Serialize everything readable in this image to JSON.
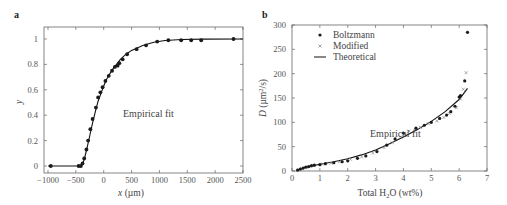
{
  "chart_data": [
    {
      "panel": "a",
      "type": "scatter",
      "title": "",
      "xlabel": "x (µm)",
      "ylabel": "y",
      "xlim": [
        -1000,
        2500
      ],
      "ylim": [
        0,
        1
      ],
      "xticks": [
        -1000,
        -500,
        0,
        500,
        1000,
        1500,
        2000,
        2500
      ],
      "xtick_labels": [
        "−1000",
        "−500",
        "0",
        "500",
        "1000",
        "1500",
        "2000",
        "2500"
      ],
      "yticks": [
        0,
        0.2,
        0.4,
        0.6,
        0.8,
        1
      ],
      "ytick_labels": [
        "0",
        "0.2",
        "0.4",
        "0.6",
        "0.8",
        "1"
      ],
      "grid": false,
      "annotations": [
        "Empirical fit"
      ],
      "series": [
        {
          "name": "data",
          "marker": "filled-circle",
          "x": [
            -950,
            -450,
            -410,
            -380,
            -350,
            -310,
            -280,
            -240,
            -200,
            -140,
            -100,
            -60,
            -20,
            30,
            90,
            150,
            200,
            250,
            280,
            340,
            420,
            590,
            760,
            960,
            1160,
            1390,
            1570,
            1750,
            2330
          ],
          "y": [
            0,
            0,
            0,
            0.02,
            0.06,
            0.13,
            0.2,
            0.29,
            0.37,
            0.46,
            0.54,
            0.58,
            0.62,
            0.67,
            0.71,
            0.75,
            0.78,
            0.79,
            0.81,
            0.84,
            0.88,
            0.92,
            0.95,
            0.98,
            0.99,
            0.99,
            0.99,
            0.99,
            1.0
          ]
        },
        {
          "name": "Empirical fit",
          "line": "solid",
          "x": [
            -1000,
            -400,
            -350,
            -300,
            -250,
            -200,
            -150,
            -100,
            -50,
            0,
            50,
            100,
            150,
            200,
            300,
            400,
            500,
            700,
            900,
            1100,
            1400,
            1800,
            2500
          ],
          "y": [
            0,
            0,
            0.05,
            0.14,
            0.24,
            0.34,
            0.43,
            0.51,
            0.57,
            0.63,
            0.68,
            0.72,
            0.755,
            0.785,
            0.84,
            0.88,
            0.91,
            0.95,
            0.975,
            0.988,
            0.996,
            0.999,
            1.0
          ]
        }
      ]
    },
    {
      "panel": "b",
      "type": "scatter",
      "title": "",
      "xlabel": "Total H₂O (wt%)",
      "ylabel": "D (µm²/s)",
      "xlim": [
        0,
        7
      ],
      "ylim": [
        0,
        300
      ],
      "xticks": [
        0,
        1,
        2,
        3,
        4,
        5,
        6,
        7
      ],
      "xtick_labels": [
        "0",
        "1",
        "2",
        "3",
        "4",
        "5",
        "6",
        "7"
      ],
      "yticks": [
        0,
        50,
        100,
        150,
        200,
        250,
        300
      ],
      "ytick_labels": [
        "0",
        "50",
        "100",
        "150",
        "200",
        "250",
        "300"
      ],
      "grid": false,
      "legend_position": "upper-left",
      "annotations": [
        "Empirical fit"
      ],
      "series": [
        {
          "name": "Boltzmann",
          "marker": "filled-circle",
          "x": [
            0.2,
            0.3,
            0.4,
            0.5,
            0.6,
            0.7,
            0.8,
            1.0,
            1.2,
            1.5,
            1.8,
            2.0,
            2.35,
            2.65,
            3.05,
            3.4,
            3.7,
            4.0,
            4.45,
            4.75,
            5.0,
            5.3,
            5.55,
            5.7,
            5.85,
            6.0,
            6.05,
            6.2,
            6.3
          ],
          "y": [
            2,
            4,
            6,
            8,
            9,
            11,
            12,
            13,
            15,
            17,
            19,
            21,
            26,
            31,
            40,
            53,
            66,
            78,
            88,
            94,
            100,
            108,
            115,
            122,
            133,
            152,
            155,
            185,
            285
          ]
        },
        {
          "name": "Modified",
          "marker": "x",
          "x": [
            0.25,
            0.35,
            0.5,
            0.65,
            0.8,
            1.1,
            1.4,
            1.7,
            2.1,
            2.5,
            2.9,
            3.3,
            3.6,
            3.9,
            4.2,
            4.6,
            4.9,
            5.2,
            5.45,
            5.65,
            5.9,
            6.05,
            6.15,
            6.25
          ],
          "y": [
            3,
            5,
            7,
            9,
            11,
            14,
            16,
            19,
            24,
            29,
            37,
            48,
            58,
            70,
            82,
            90,
            97,
            103,
            110,
            118,
            130,
            148,
            168,
            202
          ]
        },
        {
          "name": "Theoretical",
          "line": "solid",
          "x": [
            0.2,
            0.5,
            1.0,
            1.5,
            2.0,
            2.5,
            3.0,
            3.5,
            4.0,
            4.5,
            5.0,
            5.5,
            6.0,
            6.3
          ],
          "y": [
            2,
            8,
            14,
            19,
            25,
            33,
            43,
            56,
            70,
            85,
            102,
            122,
            147,
            170
          ]
        }
      ]
    }
  ],
  "panels": {
    "a": {
      "label": "a",
      "xlabel_var": "x",
      "xlabel_unit": " (µm)",
      "ylabel": "y",
      "annotation": "Empirical fit"
    },
    "b": {
      "label": "b",
      "xlabel_pre": "Total H",
      "xlabel_sub": "2",
      "xlabel_post": "O (wt%)",
      "ylabel_var": "D",
      "ylabel_unit_pre": " (µm",
      "ylabel_sup": "2",
      "ylabel_unit_post": "/s)",
      "annotation": "Empirical fit",
      "legend": [
        {
          "label": "Boltzmann",
          "marker": "filled-circle"
        },
        {
          "label": "Modified",
          "marker": "x"
        },
        {
          "label": "Theoretical",
          "marker": "line"
        }
      ]
    }
  },
  "colors": {
    "frame": "#666666",
    "marker": "#1a1a1a",
    "modified_marker": "#888888",
    "line": "#111111",
    "text": "#444444"
  }
}
